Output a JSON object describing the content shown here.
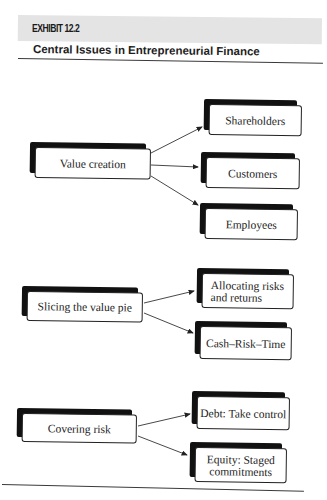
{
  "header": {
    "exhibit_label": "EXHIBIT 12.2",
    "title": "Central Issues in Entrepreneurial Finance"
  },
  "diagram": {
    "groups": [
      {
        "source": "Value creation",
        "targets": [
          "Shareholders",
          "Customers",
          "Employees"
        ]
      },
      {
        "source": "Slicing the value pie",
        "targets": [
          "Allocating risks and returns",
          "Cash–Risk–Time"
        ]
      },
      {
        "source": "Covering risk",
        "targets": [
          "Debt: Take control",
          "Equity: Staged commitments"
        ]
      }
    ]
  },
  "colors": {
    "header_band": "#e4e4e4",
    "box_shadow": "#111111",
    "text": "#1c1c1c"
  }
}
